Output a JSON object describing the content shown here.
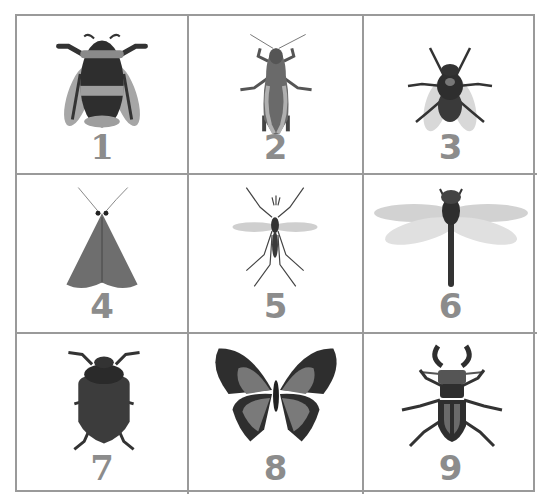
{
  "worksheet": {
    "cells": [
      {
        "number": "1",
        "insect": "bumblebee",
        "icon": "bumblebee-icon"
      },
      {
        "number": "2",
        "insect": "grasshopper",
        "icon": "grasshopper-icon"
      },
      {
        "number": "3",
        "insect": "housefly",
        "icon": "fly-icon"
      },
      {
        "number": "4",
        "insect": "moth",
        "icon": "moth-icon"
      },
      {
        "number": "5",
        "insect": "mosquito",
        "icon": "mosquito-icon"
      },
      {
        "number": "6",
        "insect": "dragonfly",
        "icon": "dragonfly-icon"
      },
      {
        "number": "7",
        "insect": "beetle",
        "icon": "beetle-icon"
      },
      {
        "number": "8",
        "insect": "butterfly",
        "icon": "butterfly-icon"
      },
      {
        "number": "9",
        "insect": "stag beetle",
        "icon": "stag-beetle-icon"
      }
    ],
    "colors": {
      "grid_line": "#9a9a9a",
      "number_text": "#8c8c8c",
      "dark": "#2e2e2e",
      "mid": "#6e6e6e",
      "light": "#b4b4b4"
    }
  }
}
